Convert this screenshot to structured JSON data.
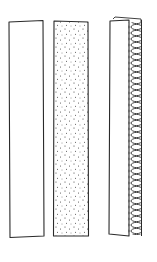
{
  "figure": {
    "stroke_color": "#2a2a2a",
    "background": "#ffffff",
    "strips": [
      {
        "id": "plain",
        "fill": "none",
        "pattern": "plain"
      },
      {
        "id": "stippled",
        "fill": "dots",
        "pattern": "stipple"
      },
      {
        "id": "coiled",
        "fill": "none",
        "pattern": "coiled-edge"
      }
    ]
  }
}
